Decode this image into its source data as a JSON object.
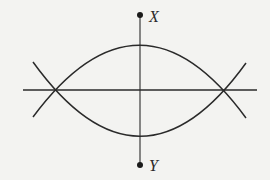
{
  "diagram": {
    "type": "geometric-construction",
    "colors": {
      "stroke": "#2a2a2a",
      "background": "#f3f3f1"
    },
    "points": [
      {
        "id": "X",
        "label": "X",
        "x": 140,
        "y": 15
      },
      {
        "id": "Y",
        "label": "Y",
        "x": 140,
        "y": 165
      }
    ],
    "intersections": [
      {
        "id": "left",
        "x": 49,
        "y": 90
      },
      {
        "id": "right",
        "x": 229,
        "y": 90
      }
    ],
    "lines": [
      {
        "id": "vertical-XY",
        "from": [
          140,
          15
        ],
        "to": [
          140,
          165
        ]
      },
      {
        "id": "horizontal",
        "from": [
          23,
          90
        ],
        "to": [
          257,
          90
        ]
      }
    ],
    "arcs": [
      {
        "id": "upper-arc",
        "from": [
          33,
          117
        ],
        "apex": [
          140,
          45
        ],
        "to": [
          246,
          118
        ]
      },
      {
        "id": "lower-arc",
        "from": [
          33,
          62
        ],
        "apex": [
          140,
          136
        ],
        "to": [
          246,
          63
        ]
      }
    ]
  },
  "labels": {
    "x_label": "X",
    "y_label": "Y"
  }
}
